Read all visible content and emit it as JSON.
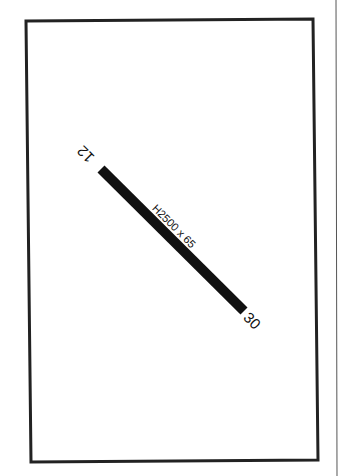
{
  "diagram": {
    "type": "airport-runway-diagram",
    "colors": {
      "background": "#ffffff",
      "frame": "#222222",
      "runway": "#111111",
      "side_rule": "#555555"
    },
    "runway": {
      "end_a_label": "12",
      "end_b_label": "30",
      "dimensions_label": "H2500 x 65"
    }
  }
}
